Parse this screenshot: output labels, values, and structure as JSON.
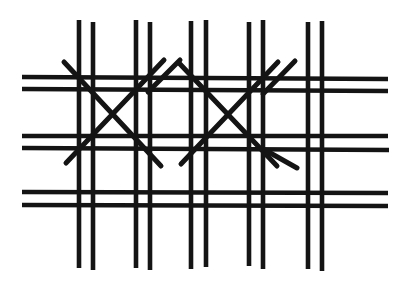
{
  "figure": {
    "kind": "line-drawing",
    "width": 407,
    "height": 290,
    "background_color": "#ffffff",
    "ink_color": "#141414"
  },
  "strokes": {
    "vertical_pairs_count": 5,
    "horizontal_pairs_count": 3,
    "diagonal_x_count": 2,
    "vertical_lines": [
      {
        "name": "vertical-1a",
        "x1": 79,
        "y1": 20,
        "x2": 79,
        "y2": 268
      },
      {
        "name": "vertical-1b",
        "x1": 93,
        "y1": 22,
        "x2": 93,
        "y2": 270
      },
      {
        "name": "vertical-2a",
        "x1": 136,
        "y1": 20,
        "x2": 136,
        "y2": 268
      },
      {
        "name": "vertical-2b",
        "x1": 150,
        "y1": 22,
        "x2": 150,
        "y2": 270
      },
      {
        "name": "vertical-3a",
        "x1": 191,
        "y1": 21,
        "x2": 191,
        "y2": 269
      },
      {
        "name": "vertical-3b",
        "x1": 206,
        "y1": 20,
        "x2": 206,
        "y2": 267
      },
      {
        "name": "vertical-4a",
        "x1": 249,
        "y1": 22,
        "x2": 249,
        "y2": 266
      },
      {
        "name": "vertical-4b",
        "x1": 263,
        "y1": 20,
        "x2": 263,
        "y2": 269
      },
      {
        "name": "vertical-5a",
        "x1": 308,
        "y1": 22,
        "x2": 308,
        "y2": 269
      },
      {
        "name": "vertical-5b",
        "x1": 322,
        "y1": 21,
        "x2": 322,
        "y2": 271
      }
    ],
    "horizontal_lines": [
      {
        "name": "horizontal-1a",
        "x1": 22,
        "y1": 77,
        "x2": 388,
        "y2": 79
      },
      {
        "name": "horizontal-1b",
        "x1": 22,
        "y1": 89,
        "x2": 388,
        "y2": 91
      },
      {
        "name": "horizontal-2a",
        "x1": 22,
        "y1": 136,
        "x2": 388,
        "y2": 136
      },
      {
        "name": "horizontal-2b",
        "x1": 22,
        "y1": 148,
        "x2": 389,
        "y2": 150
      },
      {
        "name": "horizontal-3a",
        "x1": 22,
        "y1": 192,
        "x2": 388,
        "y2": 193
      },
      {
        "name": "horizontal-3b",
        "x1": 22,
        "y1": 205,
        "x2": 388,
        "y2": 206
      }
    ],
    "diagonal_lines": [
      {
        "name": "diagonal-left-x-downright",
        "x1": 64,
        "y1": 62,
        "x2": 161,
        "y2": 166
      },
      {
        "name": "diagonal-left-x-upright",
        "x1": 66,
        "y1": 163,
        "x2": 164,
        "y2": 60
      },
      {
        "name": "diagonal-mid-left-upright",
        "x1": 148,
        "y1": 92,
        "x2": 180,
        "y2": 60
      },
      {
        "name": "diagonal-right-x-downright",
        "x1": 179,
        "y1": 63,
        "x2": 277,
        "y2": 166
      },
      {
        "name": "diagonal-right-x-upright",
        "x1": 181,
        "y1": 164,
        "x2": 278,
        "y2": 62
      },
      {
        "name": "diagonal-right-tail-upright",
        "x1": 263,
        "y1": 94,
        "x2": 295,
        "y2": 61
      },
      {
        "name": "diagonal-right-tail-downright",
        "x1": 265,
        "y1": 150,
        "x2": 297,
        "y2": 168
      }
    ]
  }
}
